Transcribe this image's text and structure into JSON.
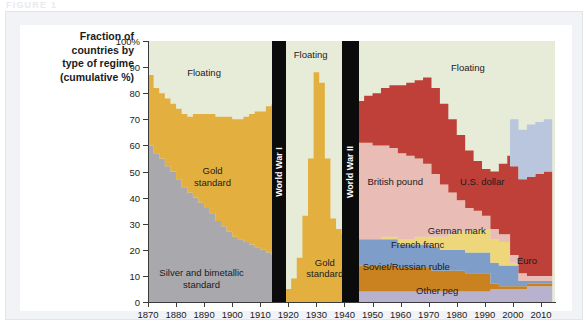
{
  "figure": {
    "kicker": "FIGURE 1"
  },
  "axis_title": "Fraction of countries by type of regime (cumulative %)",
  "axis_title_lines": [
    "Fraction of",
    "countries by",
    "type of regime",
    "(cumulative %)"
  ],
  "colors": {
    "floating": "#e7ecd9",
    "gold_standard": "#e3b040",
    "silver_bimetallic": "#a9a8ad",
    "us_dollar": "#bf4038",
    "british_pound": "#e9bcb6",
    "german_mark": "#edd77a",
    "french_franc": "#7e9dc8",
    "soviet_russian_ruble": "#c9821f",
    "euro": "#b9c6dd",
    "other_peg": "#b9b2cf",
    "war_band": "#0b0b0b",
    "axis": "#3a3a3a",
    "panel": "#f2f3f6",
    "plot_bg": "#ffffff"
  },
  "war_bands": [
    {
      "label": "World War I",
      "start": 1914,
      "end": 1919
    },
    {
      "label": "World War II",
      "start": 1939,
      "end": 1945
    }
  ],
  "plot_labels": [
    {
      "name": "floating-early",
      "text": "Floating",
      "x": 1890,
      "y": 88
    },
    {
      "name": "floating-mid",
      "text": "Floating",
      "x": 1928,
      "y": 95
    },
    {
      "name": "floating-late",
      "text": "Floating",
      "x": 1984,
      "y": 90
    },
    {
      "name": "gold-early",
      "text": "Gold\nstandard",
      "x": 1893,
      "y": 48
    },
    {
      "name": "gold-interwar",
      "text": "Gold\nstandard",
      "x": 1933,
      "y": 13
    },
    {
      "name": "silver",
      "text": "Silver and bimetallic\nstandard",
      "x": 1889,
      "y": 9
    },
    {
      "name": "us-dollar",
      "text": "U.S. dollar",
      "x": 1989,
      "y": 46
    },
    {
      "name": "british-pound",
      "text": "British pound",
      "x": 1958,
      "y": 46
    },
    {
      "name": "german-mark",
      "text": "German mark",
      "x": 1980,
      "y": 27.5
    },
    {
      "name": "french-franc",
      "text": "French franc",
      "x": 1966,
      "y": 22
    },
    {
      "name": "soviet-ruble",
      "text": "Soviet/Russian ruble",
      "x": 1962,
      "y": 13.5
    },
    {
      "name": "other-peg",
      "text": "Other peg",
      "x": 1973,
      "y": 4.5
    },
    {
      "name": "euro",
      "text": "Euro",
      "x": 2005,
      "y": 16
    }
  ],
  "chart_data": {
    "type": "area",
    "stacking": "cumulative-percent",
    "xlabel": "",
    "ylabel": "Fraction of countries by type of regime (cumulative %)",
    "xlim": [
      1870,
      2015
    ],
    "ylim": [
      0,
      100
    ],
    "grid": false,
    "legend": "inline-labels",
    "ytick_labels": [
      "0",
      "10",
      "20",
      "30",
      "40",
      "50",
      "60",
      "70",
      "80",
      "90",
      "100%"
    ],
    "ytick_values": [
      0,
      10,
      20,
      30,
      40,
      50,
      60,
      70,
      80,
      90,
      100
    ],
    "xtick_values": [
      1870,
      1880,
      1890,
      1900,
      1910,
      1920,
      1930,
      1940,
      1950,
      1960,
      1970,
      1980,
      1990,
      2000,
      2010
    ],
    "note": "Stacked area: remaining share up to 100% is 'Floating'.",
    "x": [
      1870,
      1872,
      1874,
      1876,
      1878,
      1880,
      1882,
      1884,
      1886,
      1888,
      1890,
      1892,
      1894,
      1896,
      1898,
      1900,
      1902,
      1904,
      1906,
      1908,
      1910,
      1912,
      1914,
      1919,
      1921,
      1923,
      1925,
      1927,
      1929,
      1931,
      1933,
      1935,
      1937,
      1939,
      1945,
      1947,
      1950,
      1953,
      1956,
      1959,
      1962,
      1965,
      1968,
      1971,
      1974,
      1977,
      1980,
      1983,
      1986,
      1989,
      1992,
      1995,
      1998,
      1999,
      2002,
      2005,
      2008,
      2011,
      2014
    ],
    "series": [
      {
        "name": "Silver and bimetallic standard",
        "color": "#a9a8ad",
        "values": [
          60,
          57,
          55,
          52,
          50,
          47,
          44,
          42,
          40,
          38,
          36,
          34,
          31,
          29,
          27,
          25,
          24,
          23,
          22,
          21,
          20,
          19,
          18,
          0,
          0,
          0,
          0,
          0,
          0,
          0,
          0,
          0,
          0,
          0,
          0,
          0,
          0,
          0,
          0,
          0,
          0,
          0,
          0,
          0,
          0,
          0,
          0,
          0,
          0,
          0,
          0,
          0,
          0,
          0,
          0,
          0,
          0,
          0,
          0
        ]
      },
      {
        "name": "Gold standard",
        "color": "#e3b040",
        "values": [
          27,
          25,
          25,
          26,
          26,
          27,
          28,
          29,
          32,
          34,
          36,
          38,
          40,
          42,
          44,
          45,
          46,
          48,
          50,
          52,
          53,
          56,
          58,
          5,
          9,
          17,
          33,
          55,
          88,
          84,
          55,
          32,
          28,
          26,
          0,
          0,
          0,
          0,
          0,
          0,
          0,
          0,
          0,
          0,
          0,
          0,
          0,
          0,
          0,
          0,
          0,
          0,
          0,
          0,
          0,
          0,
          0,
          0,
          0
        ]
      },
      {
        "name": "Other peg",
        "color": "#b9b2cf",
        "values": [
          0,
          0,
          0,
          0,
          0,
          0,
          0,
          0,
          0,
          0,
          0,
          0,
          0,
          0,
          0,
          0,
          0,
          0,
          0,
          0,
          0,
          0,
          0,
          0,
          0,
          0,
          0,
          0,
          0,
          0,
          0,
          0,
          0,
          0,
          4,
          4,
          4,
          4,
          4,
          4,
          4,
          4,
          4,
          4,
          4,
          4,
          4,
          4,
          4,
          4,
          5,
          5,
          5,
          5,
          5,
          6,
          6,
          6,
          6
        ]
      },
      {
        "name": "Soviet/Russian ruble",
        "color": "#c9821f",
        "values": [
          0,
          0,
          0,
          0,
          0,
          0,
          0,
          0,
          0,
          0,
          0,
          0,
          0,
          0,
          0,
          0,
          0,
          0,
          0,
          0,
          0,
          0,
          0,
          0,
          0,
          0,
          0,
          0,
          0,
          0,
          0,
          0,
          0,
          0,
          10,
          10,
          10,
          10,
          10,
          9,
          9,
          9,
          9,
          8,
          8,
          8,
          8,
          7,
          7,
          7,
          2,
          1,
          1,
          1,
          1,
          1,
          1,
          1,
          1
        ]
      },
      {
        "name": "French franc",
        "color": "#7e9dc8",
        "values": [
          0,
          0,
          0,
          0,
          0,
          0,
          0,
          0,
          0,
          0,
          0,
          0,
          0,
          0,
          0,
          0,
          0,
          0,
          0,
          0,
          0,
          0,
          0,
          0,
          0,
          0,
          0,
          0,
          0,
          0,
          0,
          0,
          0,
          0,
          10,
          10,
          10,
          10,
          10,
          9,
          9,
          9,
          9,
          9,
          8,
          8,
          8,
          8,
          8,
          8,
          8,
          8,
          8,
          8,
          2,
          1,
          1,
          1,
          1
        ]
      },
      {
        "name": "German mark",
        "color": "#edd77a",
        "values": [
          0,
          0,
          0,
          0,
          0,
          0,
          0,
          0,
          0,
          0,
          0,
          0,
          0,
          0,
          0,
          0,
          0,
          0,
          0,
          0,
          0,
          0,
          0,
          0,
          0,
          0,
          0,
          0,
          0,
          0,
          0,
          0,
          0,
          0,
          0,
          0,
          0,
          1,
          1,
          2,
          2,
          3,
          3,
          4,
          5,
          6,
          7,
          8,
          9,
          9,
          9,
          9,
          9,
          1,
          0,
          0,
          0,
          0,
          0
        ]
      },
      {
        "name": "British pound",
        "color": "#e9bcb6",
        "values": [
          0,
          0,
          0,
          0,
          0,
          0,
          0,
          0,
          0,
          0,
          0,
          0,
          0,
          0,
          0,
          0,
          0,
          0,
          0,
          0,
          0,
          0,
          0,
          0,
          0,
          0,
          0,
          0,
          0,
          0,
          0,
          0,
          0,
          0,
          37,
          37,
          36,
          35,
          34,
          33,
          32,
          30,
          28,
          24,
          20,
          16,
          12,
          9,
          7,
          5,
          4,
          3,
          3,
          3,
          3,
          2,
          2,
          2,
          2
        ]
      },
      {
        "name": "U.S. dollar",
        "color": "#bf4038",
        "values": [
          0,
          0,
          0,
          0,
          0,
          0,
          0,
          0,
          0,
          0,
          0,
          0,
          0,
          0,
          0,
          0,
          0,
          0,
          0,
          0,
          0,
          0,
          0,
          0,
          0,
          0,
          0,
          0,
          0,
          0,
          0,
          0,
          0,
          0,
          16,
          18,
          20,
          22,
          24,
          26,
          28,
          30,
          33,
          33,
          31,
          28,
          25,
          22,
          19,
          18,
          22,
          27,
          30,
          34,
          36,
          38,
          39,
          40,
          40
        ]
      },
      {
        "name": "Euro",
        "color": "#b9c6dd",
        "values": [
          0,
          0,
          0,
          0,
          0,
          0,
          0,
          0,
          0,
          0,
          0,
          0,
          0,
          0,
          0,
          0,
          0,
          0,
          0,
          0,
          0,
          0,
          0,
          0,
          0,
          0,
          0,
          0,
          0,
          0,
          0,
          0,
          0,
          0,
          0,
          0,
          0,
          0,
          0,
          0,
          0,
          0,
          0,
          0,
          0,
          0,
          0,
          0,
          0,
          0,
          0,
          0,
          0,
          18,
          19,
          20,
          20,
          20,
          20
        ]
      },
      {
        "name": "Floating",
        "color": "#e7ecd9",
        "note": "residual to 100%"
      }
    ]
  }
}
